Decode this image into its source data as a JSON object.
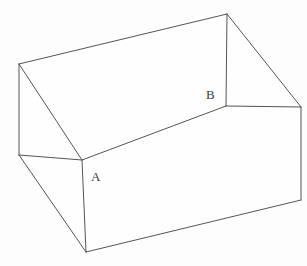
{
  "figure": {
    "background_color": "#fdfdfd",
    "line_color": "#555555",
    "label_color": "#3a3a3a",
    "width": 307,
    "height": 266,
    "labels": [
      {
        "id": "A",
        "text": "A",
        "x": 91,
        "y": 181
      },
      {
        "id": "B",
        "text": "B",
        "x": 206,
        "y": 99
      }
    ],
    "vertices": {
      "outer_top_left": {
        "x": 19,
        "y": 64
      },
      "outer_top_apex": {
        "x": 227,
        "y": 14
      },
      "outer_right": {
        "x": 301,
        "y": 107
      },
      "outer_bottom_right": {
        "x": 301,
        "y": 200
      },
      "outer_bottom_front": {
        "x": 86,
        "y": 252
      },
      "outer_left": {
        "x": 19,
        "y": 155
      },
      "inner_front_left": {
        "x": 82,
        "y": 160
      },
      "inner_front_right": {
        "x": 226,
        "y": 106
      }
    },
    "edges": [
      {
        "name": "rim-back-left",
        "points": "19,64 227,14"
      },
      {
        "name": "rim-left-vertical",
        "points": "19,64 19,155"
      },
      {
        "name": "rim-front-left",
        "points": "19,64 82,160"
      },
      {
        "name": "rim-front-right",
        "points": "82,160 226,106"
      },
      {
        "name": "rim-right-vertical",
        "points": "226,106 227,14"
      },
      {
        "name": "rim-right-outer",
        "points": "227,14 301,107"
      },
      {
        "name": "inner-to-right",
        "points": "226,106 301,107"
      },
      {
        "name": "front-face-top",
        "points": "82,160 226,106"
      },
      {
        "name": "front-left-edge",
        "points": "82,160 82,252"
      },
      {
        "name": "front-bottom",
        "points": "86,252 301,200"
      },
      {
        "name": "right-vertical",
        "points": "301,107 301,200"
      },
      {
        "name": "left-outer-vertical",
        "points": "19,155 19,64"
      },
      {
        "name": "bottom-left-diag",
        "points": "19,155 86,252"
      },
      {
        "name": "left-rim-diag",
        "points": "19,155 82,160"
      }
    ]
  }
}
